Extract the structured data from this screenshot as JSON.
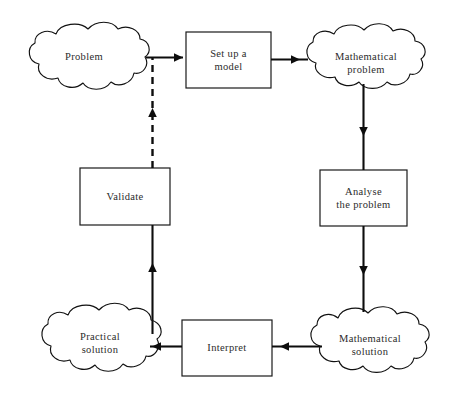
{
  "diagram": {
    "background_color": "#ffffff",
    "line_color": "#0d0d0d",
    "text_color": "#2b2b2b",
    "nodes": [
      {
        "id": "problem",
        "label": "Problem",
        "shape": "cloud",
        "x": 22,
        "y": 24,
        "width": 124,
        "height": 78
      },
      {
        "id": "set-up-a-model",
        "label": "Set up a\nmodel",
        "shape": "rectangle",
        "x": 186,
        "y": 32,
        "width": 85,
        "height": 56
      },
      {
        "id": "mathematical-problem",
        "label": "Mathematical\nproblem",
        "shape": "cloud",
        "x": 300,
        "y": 26,
        "width": 132,
        "height": 76
      },
      {
        "id": "validate",
        "label": "Validate",
        "shape": "rectangle",
        "x": 80,
        "y": 168,
        "width": 90,
        "height": 57
      },
      {
        "id": "analyse-the-problem",
        "label": "Analyse\nthe problem",
        "shape": "rectangle",
        "x": 320,
        "y": 170,
        "width": 87,
        "height": 56
      },
      {
        "id": "practical-solution",
        "label": "Practical\nsolution",
        "shape": "cloud",
        "x": 34,
        "y": 304,
        "width": 132,
        "height": 78
      },
      {
        "id": "interpret",
        "label": "Interpret",
        "shape": "rectangle",
        "x": 182,
        "y": 320,
        "width": 90,
        "height": 56
      },
      {
        "id": "mathematical-solution",
        "label": "Mathematical\nsolution",
        "shape": "cloud",
        "x": 304,
        "y": 308,
        "width": 132,
        "height": 76
      }
    ],
    "edges": [
      {
        "id": "problem-to-set-up-a-model",
        "from": "problem",
        "to": "set-up-a-model",
        "style": "solid",
        "direction": "right"
      },
      {
        "id": "set-up-a-model-to-mathematical-problem",
        "from": "set-up-a-model",
        "to": "mathematical-problem",
        "style": "solid",
        "direction": "right"
      },
      {
        "id": "mathematical-problem-to-analyse",
        "from": "mathematical-problem",
        "to": "analyse-the-problem",
        "style": "solid",
        "direction": "down"
      },
      {
        "id": "analyse-to-mathematical-solution",
        "from": "analyse-the-problem",
        "to": "mathematical-solution",
        "style": "solid",
        "direction": "down"
      },
      {
        "id": "mathematical-solution-to-interpret",
        "from": "mathematical-solution",
        "to": "interpret",
        "style": "solid",
        "direction": "left"
      },
      {
        "id": "interpret-to-practical-solution",
        "from": "interpret",
        "to": "practical-solution",
        "style": "solid",
        "direction": "left"
      },
      {
        "id": "practical-solution-to-validate",
        "from": "practical-solution",
        "to": "validate",
        "style": "solid",
        "direction": "up"
      },
      {
        "id": "validate-to-problem",
        "from": "validate",
        "to": "problem",
        "style": "dashed",
        "direction": "up"
      }
    ]
  }
}
